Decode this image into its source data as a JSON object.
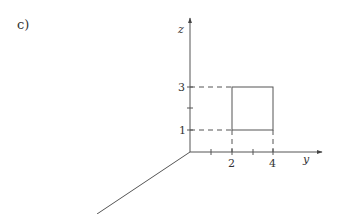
{
  "figure": {
    "part_label": "c)",
    "axes": {
      "z_label": "z",
      "y_label": "y",
      "x_label": ""
    },
    "z_ticks": [
      {
        "value": 1,
        "label": "1"
      },
      {
        "value": 2,
        "label": ""
      },
      {
        "value": 3,
        "label": "3"
      }
    ],
    "y_ticks": [
      {
        "value": 1,
        "label": ""
      },
      {
        "value": 2,
        "label": "2"
      },
      {
        "value": 3,
        "label": ""
      },
      {
        "value": 4,
        "label": "4"
      }
    ],
    "rectangle": {
      "y_min": 2,
      "y_max": 4,
      "z_min": 1,
      "z_max": 3
    },
    "colors": {
      "line": "#555555",
      "text": "#333333"
    }
  }
}
